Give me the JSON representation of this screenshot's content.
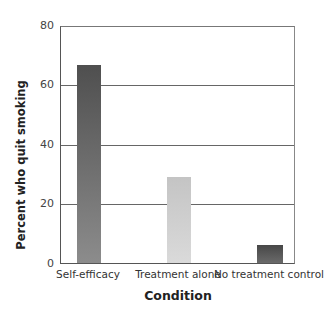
{
  "chart_data": {
    "type": "bar",
    "title": "",
    "xlabel": "Condition",
    "ylabel": "Percent who quit smoking",
    "ylim": [
      0,
      80
    ],
    "yticks": [
      0,
      20,
      40,
      60,
      80
    ],
    "grid": true,
    "legend": null,
    "categories": [
      "Self-efficacy",
      "Treatment alone",
      "No treatment control"
    ],
    "values": [
      67,
      29,
      6
    ],
    "bar_colors": [
      {
        "top": "#4f4f4f",
        "bottom": "#8c8c8c"
      },
      {
        "top": "#c4c4c4",
        "bottom": "#dadada"
      },
      {
        "top": "#474747",
        "bottom": "#6a6a6a"
      }
    ]
  },
  "axis": {
    "y_tick_labels": [
      "0",
      "20",
      "40",
      "60",
      "80"
    ]
  }
}
